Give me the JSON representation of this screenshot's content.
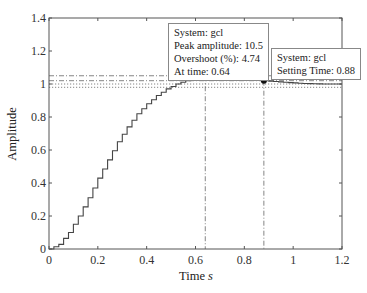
{
  "chart_data": {
    "type": "line",
    "style": "step",
    "title": "",
    "xlabel": "Time",
    "xlabel_unit": "s",
    "ylabel": "Amplitude",
    "xlim": [
      0,
      1.2
    ],
    "ylim": [
      0,
      1.4
    ],
    "xticks": [
      "0",
      "0.2",
      "0.4",
      "0.6",
      "0.8",
      "1",
      "1.2"
    ],
    "yticks": [
      "0",
      "0.2",
      "0.4",
      "0.6",
      "0.8",
      "1",
      "1.2",
      "1.4"
    ],
    "grid": false,
    "series": [
      {
        "name": "gcl",
        "sample_time": 0.02,
        "x": [
          0,
          0.04,
          0.08,
          0.12,
          0.16,
          0.2,
          0.24,
          0.28,
          0.32,
          0.36,
          0.4,
          0.44,
          0.48,
          0.52,
          0.56,
          0.6,
          0.64,
          0.7,
          0.76,
          0.82,
          0.88,
          0.96,
          1.04,
          1.12,
          1.2
        ],
        "values": [
          0,
          0.028,
          0.1,
          0.2,
          0.31,
          0.43,
          0.54,
          0.65,
          0.74,
          0.82,
          0.88,
          0.93,
          0.97,
          1.0,
          1.02,
          1.04,
          1.047,
          1.045,
          1.04,
          1.03,
          1.02,
          1.01,
          1.003,
          1.0,
          1.0
        ]
      }
    ],
    "reference_lines": [
      {
        "y": 1.05,
        "style": "dash-dot"
      },
      {
        "y": 1.02,
        "style": "dash-dot"
      },
      {
        "y": 1.0,
        "style": "dotted"
      },
      {
        "y": 0.98,
        "style": "dotted"
      },
      {
        "x": 0.64,
        "style": "dash-dot"
      },
      {
        "x": 0.88,
        "style": "dash-dot"
      }
    ],
    "markers": [
      {
        "x": 0.64,
        "y": 1.047,
        "label": "peak"
      },
      {
        "x": 0.88,
        "y": 1.02,
        "label": "settling"
      }
    ],
    "annotations": [
      {
        "lines": [
          "System: gcl",
          "Peak amplitude: 10.5",
          "Overshoot (%): 4.74",
          "At time: 0.64"
        ]
      },
      {
        "lines": [
          "System: gcl",
          "Setting Time: 0.88"
        ]
      }
    ]
  },
  "labels": {
    "ylabel": "Amplitude",
    "xlabel": "Time",
    "xlabel_unit": "s",
    "peak_box": {
      "line1": "System: gcl",
      "line2": "Peak amplitude: 10.5",
      "line3": "Overshoot (%): 4.74",
      "line4": "At time: 0.64"
    },
    "settle_box": {
      "line1": "System: gcl",
      "line2": "Setting Time: 0.88"
    }
  }
}
